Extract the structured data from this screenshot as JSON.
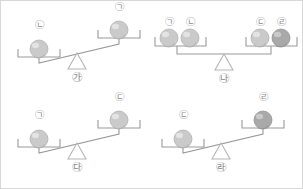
{
  "figure": {
    "background_color": "#ffffff",
    "border_color": "#d8d8d8",
    "line_color": "#9a9a9a",
    "ball_color": "#c9c9c9",
    "ball_dark_color": "#9e9e9e",
    "label_color": "#8a8a8a"
  },
  "scales": [
    {
      "id": "scale-ga",
      "fulcrum_label": "㉮",
      "state": "unbalanced",
      "tilt": "left-down",
      "left_pan": {
        "position": "down",
        "items": [
          {
            "label": "㉡",
            "shade": "light"
          }
        ]
      },
      "right_pan": {
        "position": "up",
        "items": [
          {
            "label": "㉠",
            "shade": "light"
          }
        ]
      }
    },
    {
      "id": "scale-na",
      "fulcrum_label": "㉯",
      "state": "balanced",
      "tilt": "level",
      "left_pan": {
        "position": "level",
        "items": [
          {
            "label": "㉠",
            "shade": "light"
          },
          {
            "label": "㉡",
            "shade": "light"
          }
        ]
      },
      "right_pan": {
        "position": "level",
        "items": [
          {
            "label": "㉢",
            "shade": "light"
          },
          {
            "label": "㉣",
            "shade": "dark"
          }
        ]
      }
    },
    {
      "id": "scale-da",
      "fulcrum_label": "㉰",
      "state": "unbalanced",
      "tilt": "left-down",
      "left_pan": {
        "position": "down",
        "items": [
          {
            "label": "㉠",
            "shade": "light"
          }
        ]
      },
      "right_pan": {
        "position": "up",
        "items": [
          {
            "label": "㉢",
            "shade": "light"
          }
        ]
      }
    },
    {
      "id": "scale-ra",
      "fulcrum_label": "㉱",
      "state": "unbalanced",
      "tilt": "left-down",
      "left_pan": {
        "position": "down",
        "items": [
          {
            "label": "㉢",
            "shade": "light"
          }
        ]
      },
      "right_pan": {
        "position": "up",
        "items": [
          {
            "label": "㉣",
            "shade": "dark"
          }
        ]
      }
    }
  ]
}
